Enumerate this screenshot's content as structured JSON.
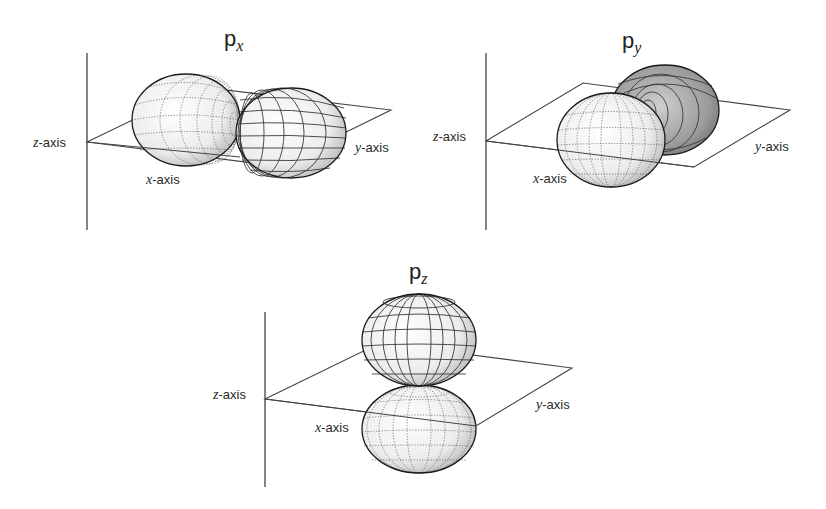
{
  "figure": {
    "panels": [
      {
        "id": "px",
        "title_main": "p",
        "title_sub": "x",
        "labels": {
          "z_var": "z",
          "z_rest": "-axis",
          "x_var": "x",
          "x_rest": "-axis",
          "y_var": "y",
          "y_rest": "-axis"
        },
        "lobe_orientation": "along x-axis"
      },
      {
        "id": "py",
        "title_main": "p",
        "title_sub": "y",
        "labels": {
          "z_var": "z",
          "z_rest": "-axis",
          "x_var": "x",
          "x_rest": "-axis",
          "y_var": "y",
          "y_rest": "-axis"
        },
        "lobe_orientation": "along y-axis"
      },
      {
        "id": "pz",
        "title_main": "p",
        "title_sub": "z",
        "labels": {
          "z_var": "z",
          "z_rest": "-axis",
          "x_var": "x",
          "x_rest": "-axis",
          "y_var": "y",
          "y_rest": "-axis"
        },
        "lobe_orientation": "along z-axis"
      }
    ]
  },
  "colors": {
    "background": "#ffffff",
    "lines": "#333333",
    "lobe_fill": "#f4f4f4"
  }
}
